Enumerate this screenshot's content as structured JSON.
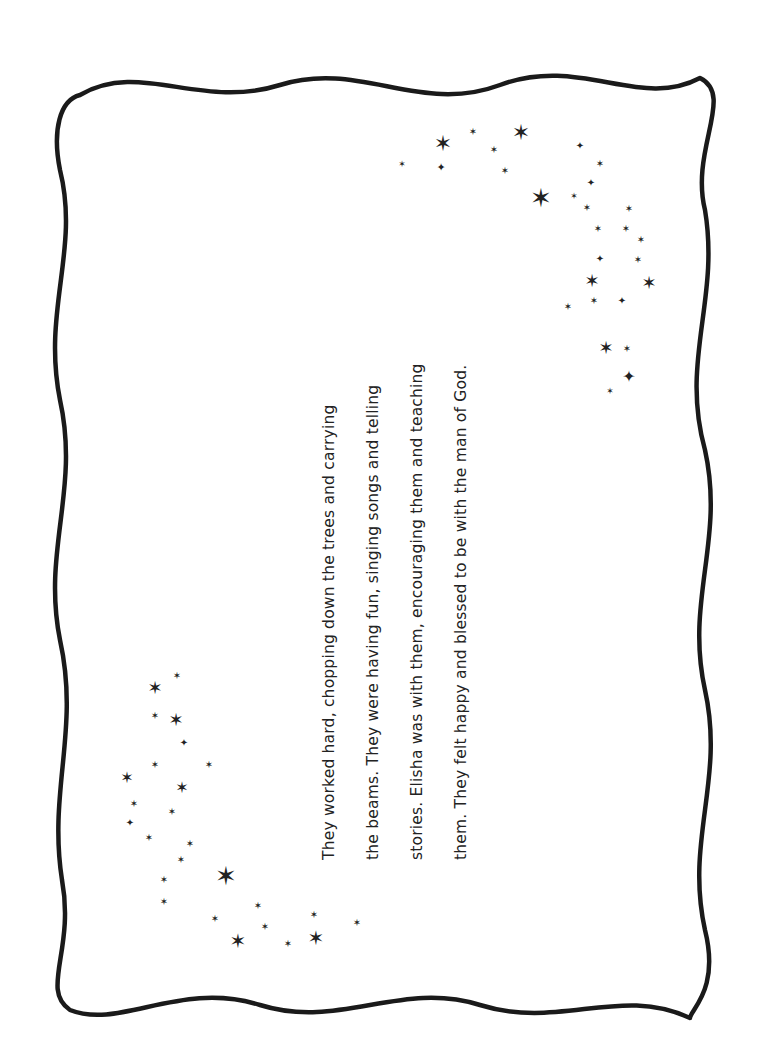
{
  "page": {
    "orientation": "landscape-rotated",
    "text_lines": [
      "They worked hard, chopping down the trees and carrying",
      "the beams. They were having fun, singing songs and telling",
      "stories. Elisha was with them, encouraging them and teaching",
      "them. They felt happy and blessed to be with the man of God."
    ]
  },
  "decorations": {
    "border": "wavy-frame",
    "star_clusters": [
      "top-right",
      "bottom-left"
    ]
  }
}
